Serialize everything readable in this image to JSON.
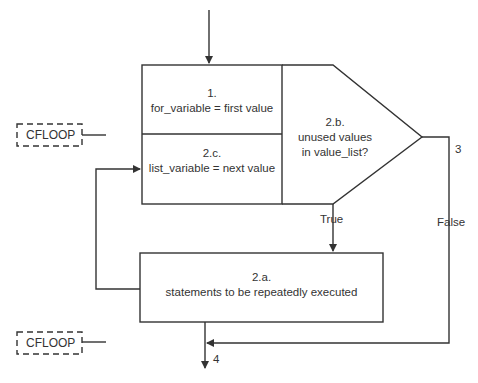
{
  "diagram": {
    "nodes": {
      "init": {
        "step": "1.",
        "text": "for_variable = first value"
      },
      "next": {
        "step": "2.c.",
        "text": "list_variable = next value"
      },
      "decision": {
        "step": "2.b.",
        "line1": "unused values",
        "line2": "in value_list?"
      },
      "body": {
        "step": "2.a.",
        "text": "statements to be repeatedly executed"
      }
    },
    "edges": {
      "true_label": "True",
      "false_label": "False",
      "exit_step": "3",
      "end_step": "4"
    },
    "tags": {
      "top": "CFLOOP",
      "bottom": "CFLOOP"
    },
    "colors": {
      "line": "#333333",
      "background": "#ffffff"
    }
  }
}
